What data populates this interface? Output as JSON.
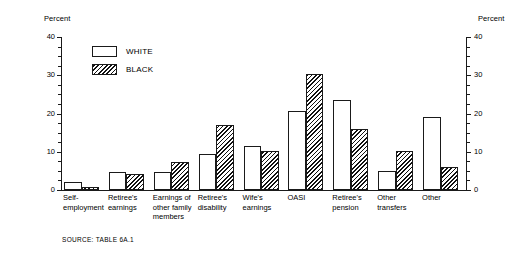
{
  "chart_data": {
    "type": "bar",
    "title": "",
    "subtitle": "",
    "xlabel": "",
    "ylabel": "Percent",
    "ylabel_right": "Percent",
    "ylim": [
      0,
      40
    ],
    "yticks": [
      0,
      10,
      20,
      30,
      40
    ],
    "ytick_labels": [
      "0",
      "10",
      "20",
      "30",
      "40"
    ],
    "yminor_step": 2.5,
    "grid": false,
    "legend_position": "upper-left-inside",
    "categories": [
      "Self-\nemployment",
      "Retiree's\nearnings",
      "Earnings of\nother family\nmembers",
      "Retiree's\ndisability",
      "Wife's\nearnings",
      "OASI",
      "Retiree's\npension",
      "Other\ntransfers",
      "Other"
    ],
    "series": [
      {
        "name": "WHITE",
        "values": [
          2.0,
          4.6,
          4.8,
          9.3,
          11.5,
          20.6,
          23.5,
          5.0,
          19.0
        ]
      },
      {
        "name": "BLACK",
        "values": [
          0.7,
          4.3,
          7.4,
          17.0,
          10.3,
          30.3,
          16.0,
          10.3,
          6.0
        ]
      }
    ],
    "annotations": [
      "SOURCE:  TABLE 6A.1"
    ]
  },
  "axes": {
    "left_title": "Percent",
    "right_title": "Percent"
  },
  "legend": {
    "items": [
      {
        "label": "WHITE",
        "swatch": "open-box-swatch"
      },
      {
        "label": "BLACK",
        "swatch": "hatched-box-swatch"
      }
    ]
  },
  "source": {
    "text": "SOURCE:  TABLE 6A.1"
  },
  "colors": {
    "ink": "#1a1a1a",
    "background": "#ffffff",
    "hatch": "#111111"
  }
}
